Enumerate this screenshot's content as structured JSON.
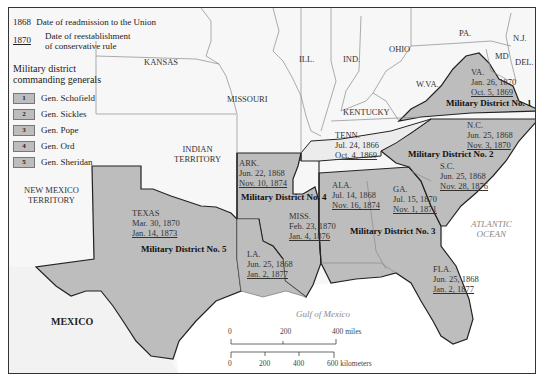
{
  "legend": {
    "readmission_year": "1868",
    "readmission_text": "Date of readmission to the Union",
    "conservative_year": "1870",
    "conservative_text_1": "Date of reestablishment",
    "conservative_text_2": "of conservative rule",
    "districts_title_1": "Military district",
    "districts_title_2": "commanding generals",
    "generals": [
      {
        "number": "1",
        "name": "Gen. Schofield"
      },
      {
        "number": "2",
        "name": "Gen. Sickles"
      },
      {
        "number": "3",
        "name": "Gen. Pope"
      },
      {
        "number": "4",
        "name": "Gen. Ord"
      },
      {
        "number": "5",
        "name": "Gen. Sheridan"
      }
    ]
  },
  "colors": {
    "district_fill": "#bdbdbd",
    "union_fill": "#f7f7f7",
    "tenn_fill": "#ececec",
    "territory_fill": "#f4f4f4",
    "water": "#ffffff",
    "district_border": "#222222",
    "state_border": "#888888"
  },
  "regions": {
    "kansas": "KANSAS",
    "missouri": "MISSOURI",
    "ill": "ILL.",
    "ind": "IND.",
    "ohio": "OHIO",
    "pa": "PA.",
    "nj": "N.J.",
    "md": "MD",
    "del": "DEL.",
    "wva": "W.VA.",
    "kentucky": "KENTUCKY",
    "indian_territory_1": "INDIAN",
    "indian_territory_2": "TERRITORY",
    "new_mexico_1": "NEW MEXICO",
    "new_mexico_2": "TERRITORY",
    "mexico": "MEXICO",
    "atlantic_1": "ATLANTIC",
    "atlantic_2": "OCEAN",
    "gulf": "Gulf of Mexico"
  },
  "states": {
    "va": {
      "name": "VA.",
      "readmitted": "Jan. 26, 1870",
      "conservative": "Oct. 5, 1869"
    },
    "nc": {
      "name": "N.C.",
      "readmitted": "Jun. 25, 1868",
      "conservative": "Nov. 3, 1870"
    },
    "sc": {
      "name": "S.C.",
      "readmitted": "Jun. 25, 1868",
      "conservative": "Nov. 28, 1876"
    },
    "ga": {
      "name": "GA.",
      "readmitted": "Jul. 15, 1870",
      "conservative": "Nov. 1, 1871"
    },
    "fla": {
      "name": "FLA.",
      "readmitted": "Jun. 25, 1868",
      "conservative": "Jan. 2, 1877"
    },
    "ala": {
      "name": "ALA.",
      "readmitted": "Jul. 14, 1868",
      "conservative": "Nov. 16, 1874"
    },
    "miss": {
      "name": "MISS.",
      "readmitted": "Feb. 23, 1870",
      "conservative": "Jan. 4, 1876"
    },
    "la": {
      "name": "LA.",
      "readmitted": "Jun. 25, 1868",
      "conservative": "Jan. 2, 1877"
    },
    "ark": {
      "name": "ARK.",
      "readmitted": "Jun. 22, 1868",
      "conservative": "Nov. 10, 1874"
    },
    "tenn": {
      "name": "TENN.",
      "readmitted": "Jul. 24, 1866",
      "conservative": "Oct. 4, 1869"
    },
    "texas": {
      "name": "TEXAS",
      "readmitted": "Mar. 30, 1870",
      "conservative": "Jan. 14, 1873"
    }
  },
  "districts": {
    "d1": "Military District No. 1",
    "d2": "Military District No. 2",
    "d3": "Military District No. 3",
    "d4": "Military District No. 4",
    "d5": "Military District No. 5"
  },
  "scale": {
    "miles_ticks": [
      "0",
      "200",
      "400 miles"
    ],
    "km_ticks": [
      "0",
      "200",
      "400",
      "600 kilometers"
    ]
  }
}
